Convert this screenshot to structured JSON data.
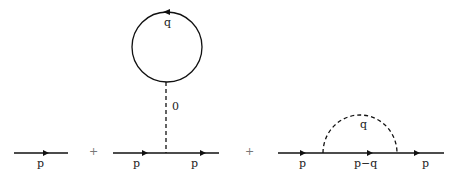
{
  "diagram": {
    "type": "feynman-self-energy",
    "terms": [
      {
        "name": "free-propagator",
        "labels": {
          "momentum": "p"
        }
      },
      {
        "name": "tadpole",
        "labels": {
          "loop_momentum": "q",
          "stem_momentum": "0",
          "incoming": "p",
          "outgoing": "p"
        }
      },
      {
        "name": "sunset",
        "labels": {
          "incoming": "p",
          "internal": "p−q",
          "outgoing": "p",
          "arc_momentum": "q"
        }
      }
    ],
    "operators": [
      "+",
      "+"
    ],
    "colors": {
      "line": "#111111",
      "text": "#222222",
      "plus": "#777777"
    }
  }
}
